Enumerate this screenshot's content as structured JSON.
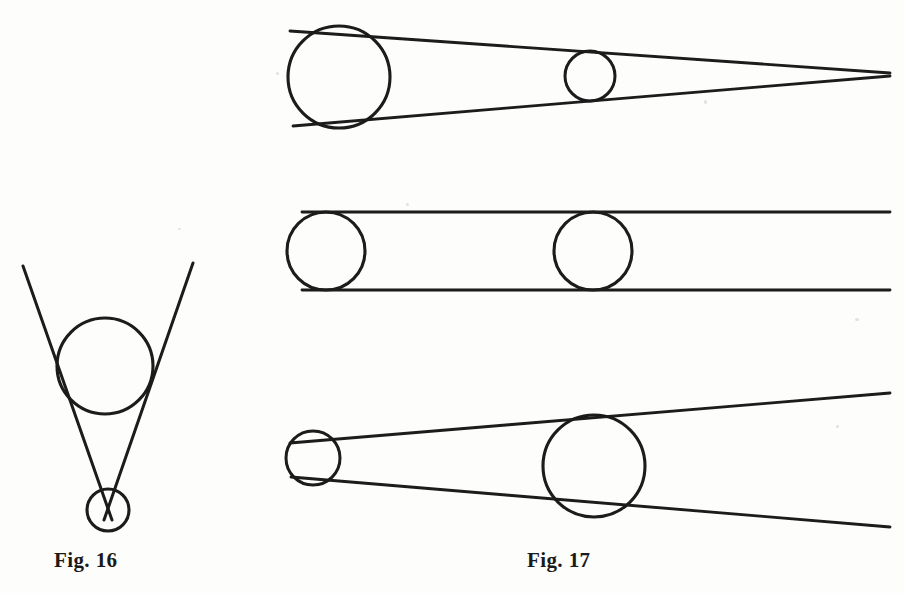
{
  "page": {
    "background_color": "#fdfdfc",
    "ink_color": "#1a1a1a",
    "width": 904,
    "height": 593,
    "kind": "scanned-book-figure-plate"
  },
  "figures": [
    {
      "id": "fig-16",
      "caption": "Fig. 16",
      "caption_position": {
        "x": 54,
        "y": 548
      },
      "description": "Two straight lines converging downward, tangent to a large circle above and meeting at a point inside a small circle below",
      "elements": {
        "large_circle": {
          "cx": 105,
          "cy": 366,
          "r": 48
        },
        "small_circle": {
          "cx": 108,
          "cy": 510,
          "r": 21
        },
        "tangent_line_left": {
          "x1": 23,
          "y1": 266,
          "x2": 112,
          "y2": 520
        },
        "tangent_line_right": {
          "x1": 193,
          "y1": 263,
          "x2": 104,
          "y2": 520
        }
      }
    },
    {
      "id": "fig-17",
      "caption": "Fig. 17",
      "caption_position": {
        "x": 527,
        "y": 548
      },
      "description": "Three stacked ray-bundle diagrams: converging cone, parallel beam, and diverging cone, each with two tangent circles",
      "panels": [
        {
          "id": "fig-17-converging",
          "label": "converging cone",
          "elements": {
            "left_circle": {
              "cx": 339,
              "cy": 77,
              "r": 51
            },
            "right_circle": {
              "cx": 590,
              "cy": 76,
              "r": 25
            },
            "tangent_line_top": {
              "x1": 290,
              "y1": 31,
              "x2": 890,
              "y2": 73
            },
            "tangent_line_bottom": {
              "x1": 293,
              "y1": 126,
              "x2": 890,
              "y2": 76
            }
          }
        },
        {
          "id": "fig-17-parallel",
          "label": "parallel beam",
          "elements": {
            "left_circle": {
              "cx": 326,
              "cy": 251,
              "r": 39
            },
            "right_circle": {
              "cx": 593,
              "cy": 251,
              "r": 39
            },
            "tangent_line_top": {
              "x1": 302,
              "y1": 212,
              "x2": 890,
              "y2": 212
            },
            "tangent_line_bottom": {
              "x1": 302,
              "y1": 290,
              "x2": 890,
              "y2": 290
            }
          }
        },
        {
          "id": "fig-17-diverging",
          "label": "diverging cone",
          "elements": {
            "left_circle": {
              "cx": 313,
              "cy": 458,
              "r": 27
            },
            "right_circle": {
              "cx": 594,
              "cy": 466,
              "r": 51
            },
            "tangent_line_top": {
              "x1": 290,
              "y1": 443,
              "x2": 890,
              "y2": 393
            },
            "tangent_line_bottom": {
              "x1": 291,
              "y1": 477,
              "x2": 890,
              "y2": 527
            }
          }
        }
      ]
    }
  ]
}
